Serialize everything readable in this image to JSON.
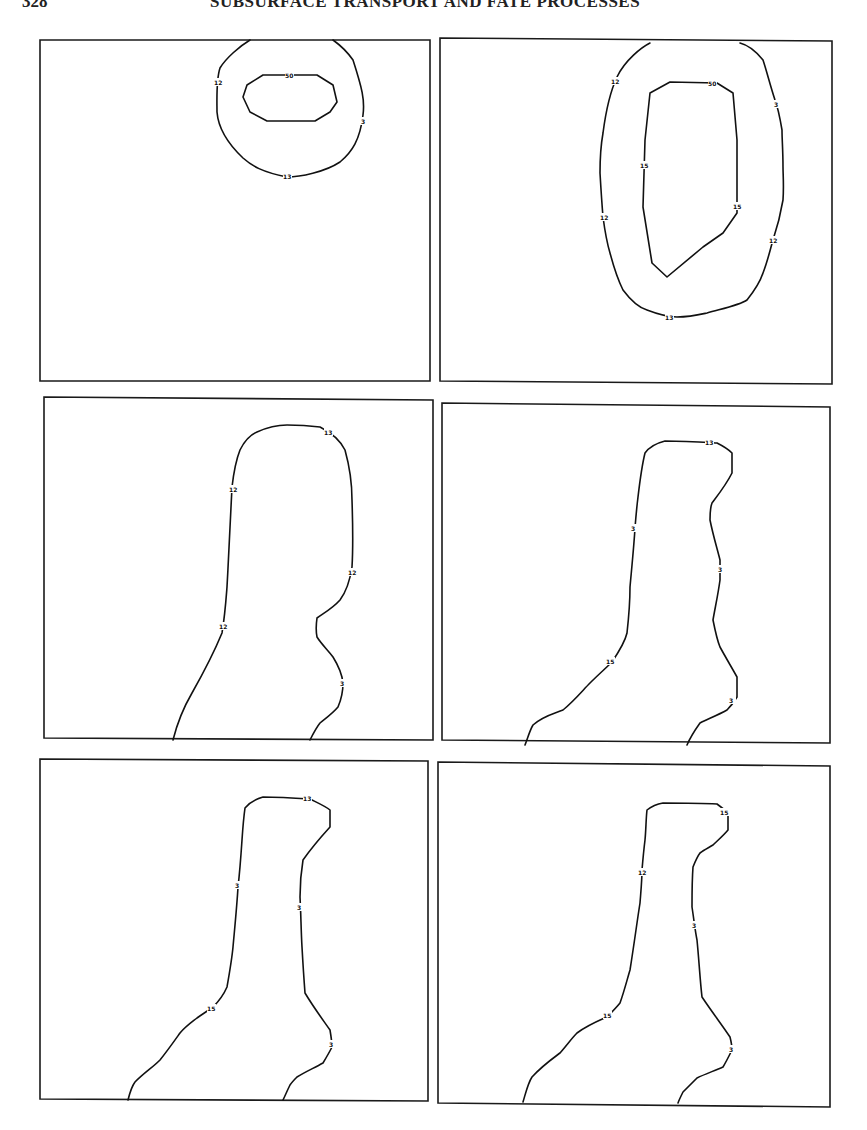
{
  "page": {
    "page_number": "328",
    "running_header": "SUBSURFACE TRANSPORT AND FATE PROCESSES"
  },
  "figure": {
    "layout": "3 rows x 2 columns of contour plot panels",
    "panels": [
      {
        "id": 1,
        "contours": [
          {
            "label": "12"
          },
          {
            "label": "3"
          },
          {
            "label": "13"
          },
          {
            "label": "50"
          }
        ],
        "labels": [
          "12",
          "50",
          "3",
          "13"
        ]
      },
      {
        "id": 2,
        "contours": [
          {
            "label": "12"
          },
          {
            "label": "3"
          },
          {
            "label": "13"
          },
          {
            "label": "50"
          },
          {
            "label": "15"
          }
        ],
        "labels": [
          "12",
          "50",
          "3",
          "15",
          "15",
          "12",
          "12",
          "13"
        ]
      },
      {
        "id": 3,
        "labels": [
          "13",
          "12",
          "12",
          "12",
          "3"
        ]
      },
      {
        "id": 4,
        "labels": [
          "13",
          "3",
          "3",
          "15",
          "3"
        ]
      },
      {
        "id": 5,
        "labels": [
          "13",
          "3",
          "3",
          "15",
          "3"
        ]
      },
      {
        "id": 6,
        "labels": [
          "15",
          "12",
          "3",
          "15",
          "3"
        ]
      }
    ]
  }
}
